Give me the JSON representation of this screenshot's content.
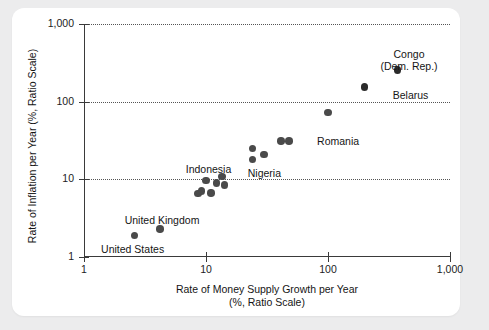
{
  "chart_data": {
    "type": "scatter",
    "title": "",
    "xlabel": "Rate of Money Supply Growth per Year",
    "xlabel_sub": "(%, Ratio Scale)",
    "ylabel": "Rate of Inflation per Year (%, Ratio Scale)",
    "xscale": "log",
    "yscale": "log",
    "xlim": [
      1,
      1000
    ],
    "ylim": [
      1,
      1000
    ],
    "xticks": [
      "1",
      "10",
      "100",
      "1,000"
    ],
    "xtick_values": [
      1,
      10,
      100,
      1000
    ],
    "yticks": [
      "1",
      "10",
      "100",
      "1,000"
    ],
    "ytick_values": [
      1,
      10,
      100,
      1000
    ],
    "grid": "horizontal-dotted",
    "legend": "none",
    "point_color": "#4a4a4a",
    "points": [
      {
        "label": "United States",
        "x": 2.6,
        "y": 1.9,
        "label_dx": -2,
        "label_dy": 14,
        "label_align": "center"
      },
      {
        "label": "United Kingdom",
        "x": 4.2,
        "y": 2.3,
        "label_dx": 2,
        "label_dy": -9,
        "label_align": "center"
      },
      {
        "label": "",
        "x": 8.6,
        "y": 6.6,
        "label_dx": 0,
        "label_dy": 0,
        "label_align": "center"
      },
      {
        "label": "",
        "x": 9.2,
        "y": 7.1,
        "label_dx": 0,
        "label_dy": 0,
        "label_align": "center"
      },
      {
        "label": "",
        "x": 10.0,
        "y": 9.6,
        "label_dx": 0,
        "label_dy": 0,
        "label_align": "center"
      },
      {
        "label": "",
        "x": 11.0,
        "y": 6.7,
        "label_dx": 0,
        "label_dy": 0,
        "label_align": "center"
      },
      {
        "label": "Indonesia",
        "x": 12.2,
        "y": 9.0,
        "label_dx": -8,
        "label_dy": -14,
        "label_align": "center"
      },
      {
        "label": "",
        "x": 13.5,
        "y": 10.8,
        "label_dx": 0,
        "label_dy": 0,
        "label_align": "center"
      },
      {
        "label": "",
        "x": 14.2,
        "y": 8.5,
        "label_dx": 0,
        "label_dy": 0,
        "label_align": "center"
      },
      {
        "label": "",
        "x": 24.0,
        "y": 25.0,
        "label_dx": 0,
        "label_dy": 0,
        "label_align": "center"
      },
      {
        "label": "Nigeria",
        "x": 24.0,
        "y": 18.0,
        "label_dx": 12,
        "label_dy": 13,
        "label_align": "center"
      },
      {
        "label": "",
        "x": 30.0,
        "y": 21.0,
        "label_dx": 0,
        "label_dy": 0,
        "label_align": "center"
      },
      {
        "label": "",
        "x": 41.0,
        "y": 31.0,
        "label_dx": 0,
        "label_dy": 0,
        "label_align": "center"
      },
      {
        "label": "Romania",
        "x": 48.0,
        "y": 31.0,
        "label_dx": 28,
        "label_dy": 0,
        "label_align": "left"
      },
      {
        "label": "",
        "x": 100.0,
        "y": 73.0,
        "label_dx": 0,
        "label_dy": 0,
        "label_align": "center"
      },
      {
        "label": "Belarus",
        "x": 200.0,
        "y": 155.0,
        "label_dx": 28,
        "label_dy": 8,
        "label_align": "left"
      },
      {
        "label": "Congo (Dem. Rep.)",
        "x": 370.0,
        "y": 255.0,
        "label_dx": 0,
        "label_dy": -24,
        "label_align": "center"
      }
    ],
    "annotations": [
      {
        "text": "Congo",
        "x_px": 409,
        "y_px": 48
      },
      {
        "text": "(Dem. Rep.)",
        "x_px": 409,
        "y_px": 60
      }
    ]
  }
}
